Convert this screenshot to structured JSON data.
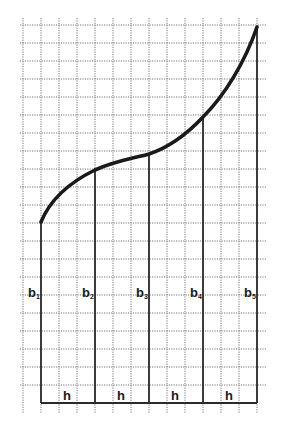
{
  "diagram": {
    "grid": {
      "x0": 23,
      "y0": 25,
      "step": 18,
      "cols": 14,
      "rows": 22,
      "color": "#6a6a6a"
    },
    "baseline_y": 403,
    "ordinates": [
      {
        "label": "b",
        "sub": "1",
        "x": 41,
        "top": 222
      },
      {
        "label": "b",
        "sub": "2",
        "x": 95,
        "top": 168
      },
      {
        "label": "b",
        "sub": "3",
        "x": 149,
        "top": 154
      },
      {
        "label": "b",
        "sub": "4",
        "x": 203,
        "top": 117
      },
      {
        "label": "b",
        "sub": "5",
        "x": 257,
        "top": 27
      }
    ],
    "interval_labels": [
      {
        "text": "h",
        "x": 63
      },
      {
        "text": "h",
        "x": 117
      },
      {
        "text": "h",
        "x": 171
      },
      {
        "text": "h",
        "x": 225
      }
    ],
    "curve_path": "M41,222 C48,205 62,186 95,170 C115,161 135,158 149,154 C170,147 188,133 203,117 C225,95 245,62 257,27"
  }
}
